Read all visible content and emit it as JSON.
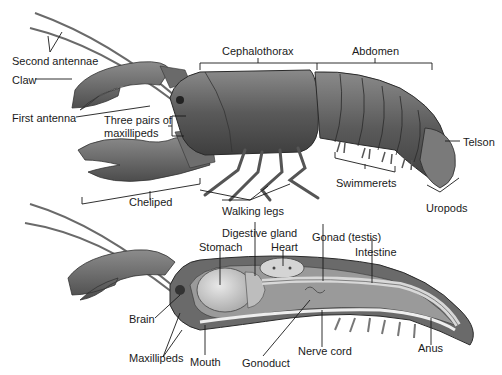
{
  "figure": {
    "external_view": {
      "labels": {
        "second_antennae": "Second antennae",
        "claw": "Claw",
        "first_antenna": "First antenna",
        "maxillipeds_line1": "Three pairs of",
        "maxillipeds_line2": "maxillipeds",
        "cephalothorax": "Cephalothorax",
        "abdomen": "Abdomen",
        "telson": "Telson",
        "swimmerets": "Swimmerets",
        "uropods": "Uropods",
        "cheliped": "Cheliped",
        "walking_legs": "Walking legs"
      }
    },
    "internal_view": {
      "labels": {
        "digestive_gland": "Digestive gland",
        "stomach": "Stomach",
        "heart": "Heart",
        "gonad": "Gonad (testis)",
        "intestine": "Intestine",
        "brain": "Brain",
        "maxillipeds": "Maxillipeds",
        "mouth": "Mouth",
        "gonoduct": "Gonoduct",
        "nerve_cord": "Nerve cord",
        "anus": "Anus"
      }
    },
    "colors": {
      "body_dark": "#4a4a4a",
      "body_mid": "#6e6e6e",
      "body_light": "#a8a8a8",
      "organ_light": "#cfcfcf",
      "line": "#1a1a1a"
    }
  }
}
